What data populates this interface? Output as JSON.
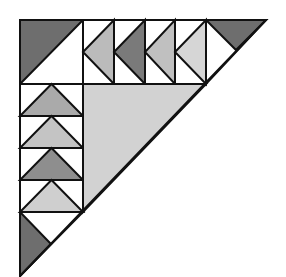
{
  "title": "Flying geese half-triangle quilt block",
  "colors": {
    "background": "#ffffff",
    "outline": "#111111",
    "corner_dark": "#6e6e6e",
    "center_light": "#d2d2d2",
    "white": "#ffffff"
  },
  "geometry": {
    "outer_triangle": [
      [
        20,
        20
      ],
      [
        266,
        20
      ],
      [
        20,
        276
      ]
    ],
    "corner_block": {
      "square": [
        [
          20,
          20
        ],
        [
          83,
          20
        ],
        [
          83,
          84
        ],
        [
          20,
          84
        ]
      ],
      "dark_half": [
        [
          20,
          20
        ],
        [
          83,
          20
        ],
        [
          20,
          84
        ]
      ]
    },
    "center_triangle": [
      [
        83,
        84
      ],
      [
        206,
        84
      ],
      [
        83,
        212
      ]
    ],
    "top_right_piece": {
      "outline": [
        [
          206,
          20
        ],
        [
          266,
          20
        ],
        [
          206,
          84
        ]
      ],
      "dark_triangle": [
        [
          206,
          20
        ],
        [
          266,
          20
        ],
        [
          236,
          50
        ]
      ]
    },
    "bottom_left_piece": {
      "outline": [
        [
          20,
          212
        ],
        [
          83,
          212
        ],
        [
          20,
          276
        ]
      ],
      "dark_triangle": [
        [
          20,
          212
        ],
        [
          51,
          244
        ],
        [
          20,
          276
        ]
      ]
    }
  },
  "top_row_geese": [
    {
      "x0": 83,
      "x1": 114,
      "fill": "#bbbbbb",
      "direction": "left"
    },
    {
      "x0": 114,
      "x1": 145,
      "fill": "#7a7a7a",
      "direction": "left"
    },
    {
      "x0": 145,
      "x1": 175,
      "fill": "#c0c0c0",
      "direction": "left"
    },
    {
      "x0": 175,
      "x1": 206,
      "fill": "#d6d6d6",
      "direction": "left"
    }
  ],
  "top_row_bounds": {
    "y0": 20,
    "y1": 84
  },
  "left_column_geese": [
    {
      "y0": 84,
      "y1": 116,
      "fill": "#aaaaaa",
      "direction": "up"
    },
    {
      "y0": 116,
      "y1": 148,
      "fill": "#c4c4c4",
      "direction": "up"
    },
    {
      "y0": 148,
      "y1": 180,
      "fill": "#8e8e8e",
      "direction": "up"
    },
    {
      "y0": 180,
      "y1": 212,
      "fill": "#cfcfcf",
      "direction": "up"
    }
  ],
  "left_column_bounds": {
    "x0": 20,
    "x1": 83
  }
}
